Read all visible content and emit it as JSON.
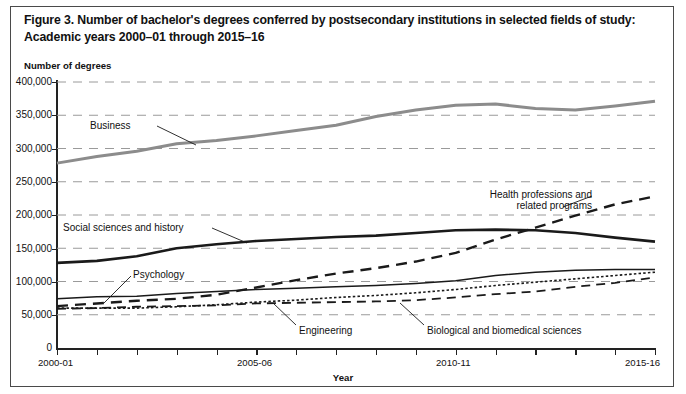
{
  "figure": {
    "title": "Figure 3. Number of bachelor's degrees conferred by postsecondary institutions in selected fields of study: Academic years 2000–01 through 2015–16",
    "y_axis_title": "Number of degrees",
    "x_axis_title": "Year"
  },
  "chart_data": {
    "type": "line",
    "title": "Figure 3. Number of bachelor's degrees conferred by postsecondary institutions in selected fields of study: Academic years 2000–01 through 2015–16",
    "xlabel": "Year",
    "ylabel": "Number of degrees",
    "ylim": [
      0,
      400000
    ],
    "ytick_labels": [
      "400,000",
      "350,000",
      "300,000",
      "250,000",
      "200,000",
      "150,000",
      "100,000",
      "50,000",
      "0"
    ],
    "ytick_values": [
      400000,
      350000,
      300000,
      250000,
      200000,
      150000,
      100000,
      50000,
      0
    ],
    "grid": "horizontal-dashed",
    "legend": "inline-annotations",
    "x": [
      "2000-01",
      "2001-02",
      "2002-03",
      "2003-04",
      "2004-05",
      "2005-06",
      "2006-07",
      "2007-08",
      "2008-09",
      "2009-10",
      "2010-11",
      "2011-12",
      "2012-13",
      "2013-14",
      "2014-15",
      "2015-16"
    ],
    "xtick_labels_shown": [
      "2000-01",
      "2005-06",
      "2010-11",
      "2015-16"
    ],
    "xtick_indices_shown": [
      0,
      5,
      10,
      15
    ],
    "series": [
      {
        "name": "Business",
        "style": "solid-thick-gray",
        "color": "#8c8c8c",
        "values": [
          278000,
          288000,
          296000,
          307000,
          312000,
          319000,
          327000,
          335000,
          348000,
          358000,
          365000,
          367000,
          360000,
          358000,
          364000,
          371000
        ]
      },
      {
        "name": "Social sciences and history",
        "style": "solid-thick-black",
        "color": "#1a1a1a",
        "values": [
          128000,
          131000,
          138000,
          150000,
          156000,
          161000,
          164000,
          167000,
          169000,
          173000,
          177000,
          178000,
          177000,
          173000,
          166000,
          160000
        ]
      },
      {
        "name": "Health professions and related programs",
        "style": "dashed-long",
        "color": "#1a1a1a",
        "values": [
          63000,
          67000,
          71000,
          74000,
          80000,
          91000,
          102000,
          112000,
          120000,
          130000,
          143000,
          163000,
          181000,
          199000,
          216000,
          228000
        ]
      },
      {
        "name": "Psychology",
        "style": "solid-thin-black",
        "color": "#1a1a1a",
        "values": [
          74000,
          77000,
          78000,
          82000,
          85000,
          88000,
          90000,
          92000,
          94000,
          97000,
          101000,
          109000,
          114000,
          117000,
          118000,
          118000
        ]
      },
      {
        "name": "Biological and biomedical sciences",
        "style": "dotted-fine",
        "color": "#1a1a1a",
        "values": [
          60000,
          60000,
          60000,
          62000,
          65000,
          69000,
          72000,
          76000,
          79000,
          83000,
          88000,
          94000,
          99000,
          104000,
          109000,
          114000
        ]
      },
      {
        "name": "Engineering",
        "style": "dashed-medium",
        "color": "#1a1a1a",
        "values": [
          59000,
          60000,
          62000,
          63000,
          64000,
          67000,
          68000,
          69000,
          70000,
          72000,
          76000,
          81000,
          85000,
          92000,
          98000,
          106000
        ]
      }
    ],
    "annotations": [
      {
        "label": "Business",
        "target_series": "Business"
      },
      {
        "label": "Social sciences and history",
        "target_series": "Social sciences and history"
      },
      {
        "label": "Psychology",
        "target_series": "Psychology"
      },
      {
        "label": "Health professions and",
        "target_series": "Health professions and related programs"
      },
      {
        "label": "related programs",
        "target_series": "Health professions and related programs"
      },
      {
        "label": "Engineering",
        "target_series": "Engineering"
      },
      {
        "label": "Biological and biomedical sciences",
        "target_series": "Biological and biomedical sciences"
      }
    ]
  },
  "labels": {
    "business": "Business",
    "social": "Social sciences and history",
    "psychology": "Psychology",
    "health_line1": "Health professions and",
    "health_line2": "related programs",
    "engineering": "Engineering",
    "biological": "Biological and biomedical sciences"
  },
  "yticks": [
    "400,000",
    "350,000",
    "300,000",
    "250,000",
    "200,000",
    "150,000",
    "100,000",
    "50,000",
    "0"
  ],
  "xticks": [
    "2000-01",
    "2005-06",
    "2010-11",
    "2015-16"
  ]
}
